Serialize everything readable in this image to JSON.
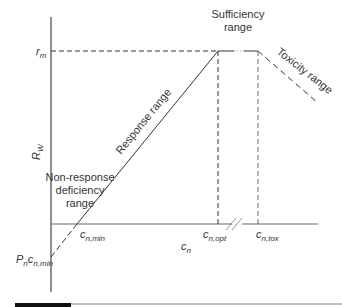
{
  "diagram": {
    "y_axis_label": "R",
    "y_axis_sub": "W",
    "x_axis_label": "c",
    "x_axis_sub": "n",
    "r_max_label": "r",
    "r_max_sub": "m",
    "intercept_label": "P",
    "intercept_sub1": "n",
    "intercept_c": "c",
    "intercept_sub2": "n,min",
    "cmin_label": "c",
    "cmin_sub": "n,min",
    "copt_label": "c",
    "copt_sub": "n,opt",
    "ctox_label": "c",
    "ctox_sub": "n,tox",
    "ranges": {
      "nonresponse_line1": "Non-response",
      "nonresponse_line2": "deficiency",
      "nonresponse_line3": "range",
      "response": "Response range",
      "sufficiency_line1": "Sufficiency",
      "sufficiency_line2": "range",
      "toxicity": "Toxicity range"
    }
  },
  "colors": {
    "line": "#333333",
    "axis": "#555555",
    "text": "#333333"
  }
}
